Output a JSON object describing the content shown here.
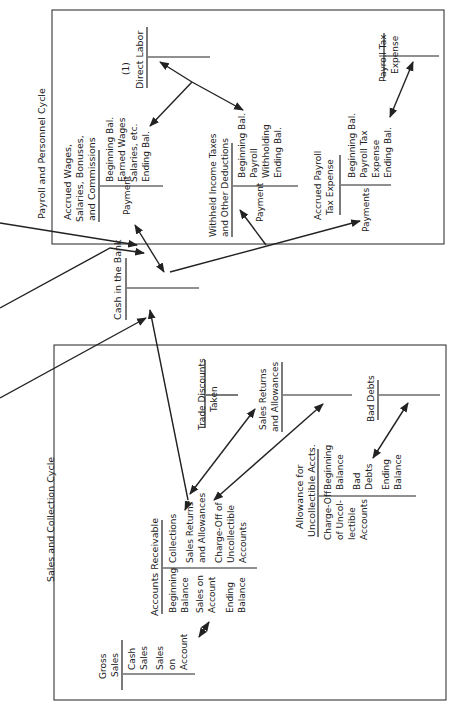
{
  "diagram": {
    "orientation": "rotated-90-ccw",
    "payroll_cycle": {
      "title": "Payroll and Personnel Cycle",
      "accounts": {
        "direct_labor": {
          "title_line1": "(1)",
          "title_line2": "Direct Labor",
          "debits": [],
          "credits": []
        },
        "accrued_wages": {
          "title_line1": "Accrued Wages,",
          "title_line2": "Salaries, Bonuses,",
          "title_line3": "and Commissions",
          "debit_1": "Payment",
          "credit_1": "Beginning Bal.",
          "credit_2": "Earned Wages",
          "credit_3": "Salaries, etc.",
          "credit_4": "Ending Bal."
        },
        "withheld_taxes": {
          "title_line1": "Withheld Income Taxes",
          "title_line2": "and Other Deductions",
          "debit_1": "Payment",
          "credit_1": "Beginning Bal.",
          "credit_2": "Payroll",
          "credit_3": "Withholding",
          "credit_4": "Ending Bal."
        },
        "accrued_payroll_tax": {
          "title_line1": "Accrued Payroll",
          "title_line2": "Tax Expense",
          "debit_1": "Payments",
          "credit_1": "Beginning Bal.",
          "credit_2": "Payroll Tax",
          "credit_3": "Expense",
          "credit_4": "Ending Bal."
        },
        "payroll_tax_expense": {
          "title_line1": "Payroll Tax",
          "title_line2": "Expense"
        }
      }
    },
    "cash": {
      "title": "Cash in the Bank"
    },
    "sales_cycle": {
      "title": "Sales and Collection Cycle",
      "accounts": {
        "gross_sales": {
          "title_line1": "Gross",
          "title_line2": "Sales",
          "credit_1": "Cash",
          "credit_2": "Sales",
          "credit_3": "Sales",
          "credit_4": "on",
          "credit_5": "Account"
        },
        "accounts_receivable": {
          "title": "Accounts Receivable",
          "debit_1": "Beginning",
          "debit_2": "Balance",
          "debit_3": "Sales on",
          "debit_4": "Account",
          "debit_5": "Ending",
          "debit_6": "Balance",
          "credit_1": "Collections",
          "credit_2": "Sales Returns",
          "credit_3": "and Allowances",
          "credit_4": "Charge-Off of",
          "credit_5": "Uncollectible",
          "credit_6": "Accounts"
        },
        "trade_discounts": {
          "title_line1": "Trade Discounts",
          "title_line2": "Taken"
        },
        "sales_returns": {
          "title_line1": "Sales Returns",
          "title_line2": "and Allowances"
        },
        "allowance": {
          "title_line1": "Allowance for",
          "title_line2": "Uncollectible Accts.",
          "debit_1": "Charge-Off",
          "debit_2": "of Uncol-",
          "debit_3": "lectible",
          "debit_4": "Accounts",
          "credit_1": "Beginning",
          "credit_2": "Balance",
          "credit_3": "Bad",
          "credit_4": "Debts",
          "credit_5": "Ending",
          "credit_6": "Balance"
        },
        "bad_debts": {
          "title": "Bad Debts"
        }
      }
    }
  }
}
